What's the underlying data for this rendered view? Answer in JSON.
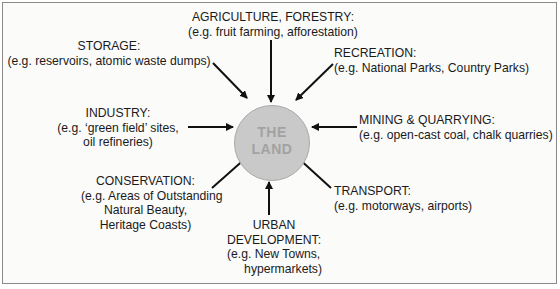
{
  "center": {
    "line1": "THE",
    "line2": "LAND",
    "fill": "#c9c9c9"
  },
  "uses": [
    {
      "id": "agriculture",
      "title": "AGRICULTURE, FORESTRY:",
      "lines": [
        "(e.g. fruit farming, afforestation)"
      ]
    },
    {
      "id": "storage",
      "title": "STORAGE:",
      "lines": [
        "(e.g. reservoirs, atomic waste dumps)"
      ]
    },
    {
      "id": "recreation",
      "title": "RECREATION:",
      "lines": [
        "(e.g. National Parks, Country Parks)"
      ]
    },
    {
      "id": "industry",
      "title": "INDUSTRY:",
      "lines": [
        "(e.g. ‘green field’ sites,",
        "oil refineries)"
      ]
    },
    {
      "id": "mining",
      "title": "MINING & QUARRYING:",
      "lines": [
        "(e.g. open-cast coal, chalk quarries)"
      ]
    },
    {
      "id": "conservation",
      "title": "CONSERVATION:",
      "lines": [
        "(e.g. Areas of Outstanding",
        "Natural Beauty,",
        "Heritage Coasts)"
      ]
    },
    {
      "id": "transport",
      "title": "TRANSPORT:",
      "lines": [
        "(e.g. motorways, airports)"
      ]
    },
    {
      "id": "urban",
      "title": "URBAN",
      "title2": "DEVELOPMENT:",
      "lines": [
        "(e.g. New Towns,",
        "hypermarkets)"
      ]
    }
  ]
}
